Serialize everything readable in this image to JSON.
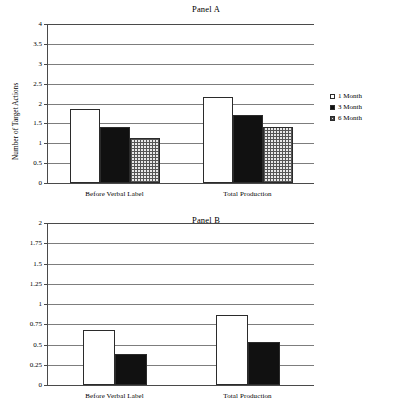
{
  "figure": {
    "panels": [
      {
        "id": "panel-a",
        "title": "Panel A",
        "legend": [
          {
            "label": "1 Month",
            "style": "open-white"
          },
          {
            "label": "3 Month",
            "style": "solid-black"
          },
          {
            "label": "6 Month",
            "style": "crosshatch-gray"
          }
        ]
      },
      {
        "id": "panel-b",
        "title": "Panel B",
        "legend": [
          {
            "label": "1 Month",
            "style": "open-white"
          },
          {
            "label": "3 Month",
            "style": "solid-black"
          }
        ]
      }
    ]
  },
  "chart_data": [
    {
      "type": "bar",
      "title": "Panel A",
      "xlabel": "",
      "ylabel": "Number of Target Actions",
      "ylim": [
        0,
        4
      ],
      "yticks": [
        0,
        0.5,
        1,
        1.5,
        2,
        2.5,
        3,
        3.5,
        4
      ],
      "ytick_labels": [
        "0",
        "0.5",
        "1",
        "1.5",
        "2",
        "2.5",
        "3",
        "3.5",
        "4"
      ],
      "grid": true,
      "legend_position": "right",
      "categories": [
        "Before Verbal Label",
        "Total Production"
      ],
      "series": [
        {
          "name": "1 Month",
          "values": [
            1.85,
            2.17
          ]
        },
        {
          "name": "3 Month",
          "values": [
            1.4,
            1.71
          ]
        },
        {
          "name": "6 Month",
          "values": [
            1.12,
            1.4
          ]
        }
      ]
    },
    {
      "type": "bar",
      "title": "Panel B",
      "xlabel": "",
      "ylabel": "Number of Ordered Pairs",
      "ylim": [
        0,
        2
      ],
      "yticks": [
        0,
        0.25,
        0.5,
        0.75,
        1,
        1.25,
        1.5,
        1.75,
        2
      ],
      "ytick_labels": [
        "0",
        "0.25",
        "0.5",
        "0.75",
        "1",
        "1.25",
        "1.5",
        "1.75",
        "2"
      ],
      "grid": true,
      "legend_position": "right",
      "categories": [
        "Before Verbal Label",
        "Total Production"
      ],
      "series": [
        {
          "name": "1 Month",
          "values": [
            0.68,
            0.86
          ]
        },
        {
          "name": "3 Month",
          "values": [
            0.38,
            0.53
          ]
        }
      ]
    }
  ]
}
